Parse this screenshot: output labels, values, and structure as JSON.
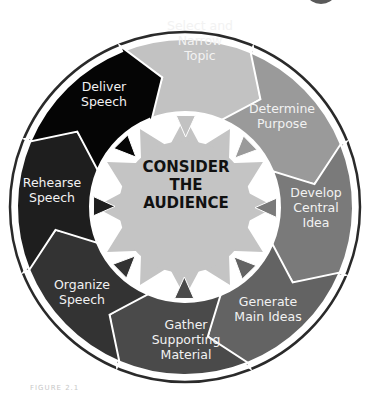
{
  "diagram": {
    "center": {
      "lines": [
        "CONSIDER",
        "THE",
        "AUDIENCE"
      ],
      "color": "#c4c4c4"
    },
    "steps": [
      {
        "label_lines": [
          "Select and",
          "Narrow",
          "Topic"
        ],
        "color": "#c2c2c2"
      },
      {
        "label_lines": [
          "Determine",
          "Purpose"
        ],
        "color": "#9a9a9a"
      },
      {
        "label_lines": [
          "Develop",
          "Central",
          "Idea"
        ],
        "color": "#7a7a7a"
      },
      {
        "label_lines": [
          "Generate",
          "Main Ideas"
        ],
        "color": "#636363"
      },
      {
        "label_lines": [
          "Gather",
          "Supporting",
          "Material"
        ],
        "color": "#4a4a4a"
      },
      {
        "label_lines": [
          "Organize",
          "Speech"
        ],
        "color": "#333333"
      },
      {
        "label_lines": [
          "Rehearse",
          "Speech"
        ],
        "color": "#1e1e1e"
      },
      {
        "label_lines": [
          "Deliver",
          "Speech"
        ],
        "color": "#050505"
      }
    ],
    "caption": "FIGURE 2.1"
  }
}
